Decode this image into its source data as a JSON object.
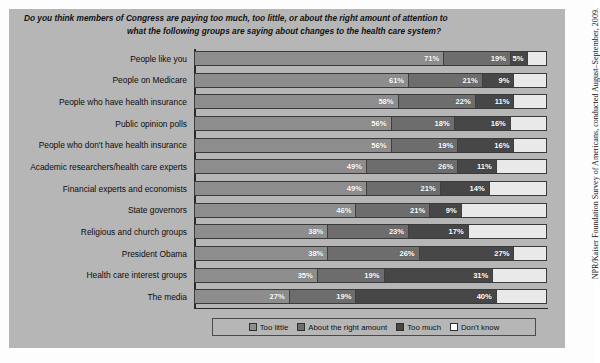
{
  "title": {
    "line1": "Do you think members of Congress are paying too much, too little, or about the right amount of attention to",
    "line2": "what the following groups are saying about changes to the health care system?"
  },
  "source_note": "NPR/Kaiser Foundation Survey of Americans, conducted August–September, 2009.",
  "legend": {
    "items": [
      {
        "label": "Too little",
        "color": "#8d8d8d"
      },
      {
        "label": "About the right amount",
        "color": "#6d6d6d"
      },
      {
        "label": "Too much",
        "color": "#474747"
      },
      {
        "label": "Don't know",
        "color": "#ffffff"
      }
    ]
  },
  "chart_data": {
    "type": "bar",
    "orientation": "horizontal",
    "stacked": true,
    "stack_total": 100,
    "title": "Do you think members of Congress are paying too much, too little, or about the right amount of attention to what the following groups are saying about changes to the health care system?",
    "xlabel": "",
    "ylabel": "",
    "xlim": [
      0,
      100
    ],
    "grid": false,
    "legend_position": "bottom",
    "value_suffix": "%",
    "categories": [
      "People like you",
      "People on Medicare",
      "People who have health insurance",
      "Public opinion polls",
      "People who don't have health insurance",
      "Academic researchers/health care experts",
      "Financial experts and economists",
      "State governors",
      "Religious and church groups",
      "President Obama",
      "Health care interest groups",
      "The media"
    ],
    "series": [
      {
        "name": "Too little",
        "color": "#8d8d8d",
        "values": [
          71,
          61,
          58,
          56,
          56,
          49,
          49,
          46,
          38,
          38,
          35,
          27
        ]
      },
      {
        "name": "About the right amount",
        "color": "#6d6d6d",
        "values": [
          19,
          21,
          22,
          18,
          19,
          26,
          21,
          21,
          23,
          26,
          19,
          19
        ]
      },
      {
        "name": "Too much",
        "color": "#474747",
        "values": [
          5,
          9,
          11,
          16,
          16,
          11,
          14,
          9,
          17,
          27,
          31,
          40
        ]
      },
      {
        "name": "Don't know",
        "color": "#e9e9e9",
        "values": [
          5,
          9,
          9,
          10,
          9,
          14,
          16,
          24,
          22,
          9,
          15,
          14
        ]
      }
    ],
    "labeled_values": [
      {
        "category": "People like you",
        "Too little": "71%",
        "About the right amount": "19%",
        "Too much": "5%",
        "Don't know": ""
      },
      {
        "category": "People on Medicare",
        "Too little": "61%",
        "About the right amount": "21%",
        "Too much": "9%",
        "Don't know": ""
      },
      {
        "category": "People who have health insurance",
        "Too little": "58%",
        "About the right amount": "22%",
        "Too much": "11%",
        "Don't know": ""
      },
      {
        "category": "Public opinion polls",
        "Too little": "56%",
        "About the right amount": "18%",
        "Too much": "16%",
        "Don't know": ""
      },
      {
        "category": "People who don't have health insurance",
        "Too little": "56%",
        "About the right amount": "19%",
        "Too much": "16%",
        "Don't know": ""
      },
      {
        "category": "Academic researchers/health care experts",
        "Too little": "49%",
        "About the right amount": "26%",
        "Too much": "11%",
        "Don't know": ""
      },
      {
        "category": "Financial experts and economists",
        "Too little": "49%",
        "About the right amount": "21%",
        "Too much": "14%",
        "Don't know": ""
      },
      {
        "category": "State governors",
        "Too little": "46%",
        "About the right amount": "21%",
        "Too much": "9%",
        "Don't know": ""
      },
      {
        "category": "Religious and church groups",
        "Too little": "38%",
        "About the right amount": "23%",
        "Too much": "17%",
        "Don't know": ""
      },
      {
        "category": "President Obama",
        "Too little": "38%",
        "About the right amount": "26%",
        "Too much": "27%",
        "Don't know": ""
      },
      {
        "category": "Health care interest groups",
        "Too little": "35%",
        "About the right amount": "19%",
        "Too much": "31%",
        "Don't know": ""
      },
      {
        "category": "The media",
        "Too little": "27%",
        "About the right amount": "19%",
        "Too much": "40%",
        "Don't know": ""
      }
    ]
  }
}
